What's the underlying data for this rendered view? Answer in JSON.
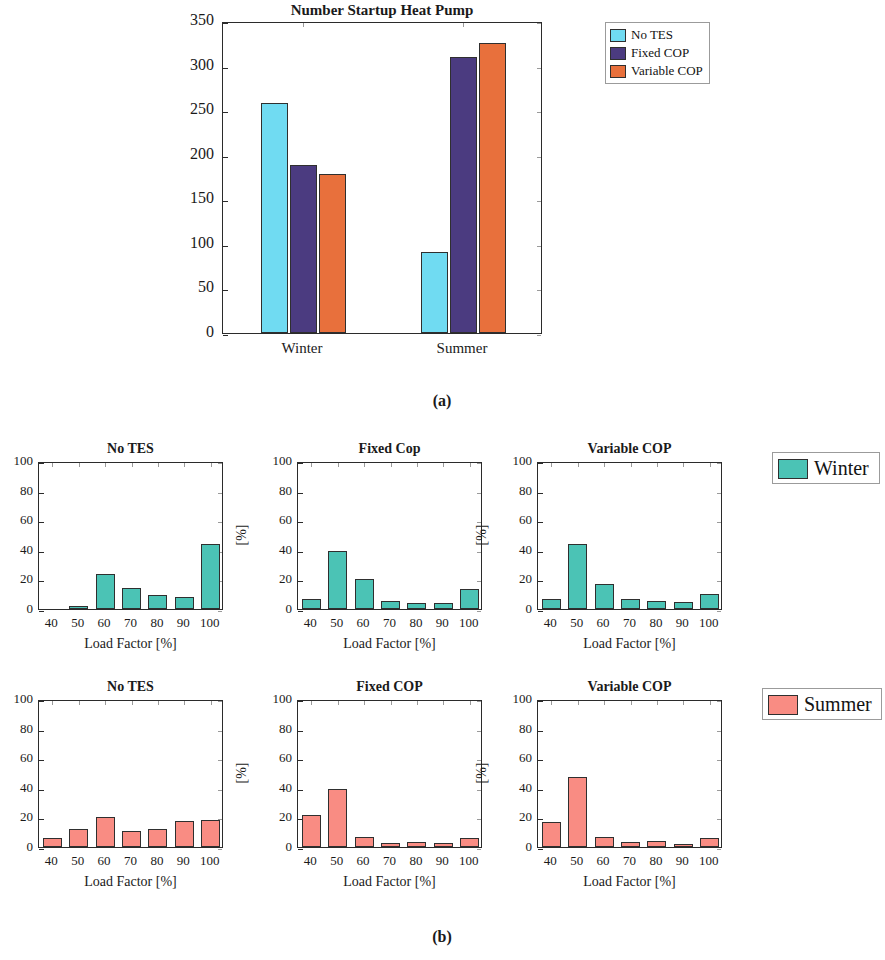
{
  "figure": {
    "subfig_a_label": "(a)",
    "subfig_b_label": "(b)"
  },
  "colors": {
    "no_tes": "#70DBF2",
    "fixed_cop": "#4B3B80",
    "variable_cop": "#E8703C",
    "winter": "#4BC3B5",
    "summer": "#F98C83",
    "axis": "#2b2b2b"
  },
  "panel_a": {
    "title": "Number Startup Heat Pump",
    "legend": [
      "No TES",
      "Fixed COP",
      "Variable COP"
    ],
    "ytick_labels": [
      "350",
      "300",
      "250",
      "200",
      "150",
      "100",
      "50",
      "0"
    ],
    "xtick_labels": [
      "Winter",
      "Summer"
    ]
  },
  "panel_b": {
    "winter_legend": "Winter",
    "summer_legend": "Summer",
    "ytick_labels": [
      "100",
      "80",
      "60",
      "40",
      "20",
      "0"
    ],
    "xtick_labels": [
      "40",
      "50",
      "60",
      "70",
      "80",
      "90",
      "100"
    ],
    "xlabel": "Load Factor [%]",
    "ylabel": "[%]",
    "titles_row1": [
      "No TES",
      "Fixed Cop",
      "Variable COP"
    ],
    "titles_row2": [
      "No TES",
      "Fixed COP",
      "Variable COP"
    ]
  },
  "chart_data": [
    {
      "type": "bar",
      "id": "panel_a",
      "title": "Number Startup Heat Pump",
      "xlabel": "",
      "ylabel": "",
      "categories": [
        "Winter",
        "Summer"
      ],
      "ylim": [
        0,
        350
      ],
      "yticks": [
        0,
        50,
        100,
        150,
        200,
        250,
        300,
        350
      ],
      "grid": false,
      "legend_position": "outside-top-right",
      "series": [
        {
          "name": "No TES",
          "color": "#70DBF2",
          "values": [
            258,
            91
          ]
        },
        {
          "name": "Fixed COP",
          "color": "#4B3B80",
          "values": [
            188,
            310
          ]
        },
        {
          "name": "Variable COP",
          "color": "#E8703C",
          "values": [
            178,
            325
          ]
        }
      ]
    },
    {
      "type": "bar",
      "id": "winter_no_tes",
      "title": "No TES",
      "season": "Winter",
      "xlabel": "Load Factor [%]",
      "ylabel": "[%]",
      "categories": [
        "40",
        "50",
        "60",
        "70",
        "80",
        "90",
        "100"
      ],
      "values": [
        0,
        2,
        23.5,
        14,
        9.5,
        8,
        44
      ],
      "ylim": [
        0,
        100
      ],
      "yticks": [
        0,
        20,
        40,
        60,
        80,
        100
      ],
      "color": "#4BC3B5",
      "grid": false
    },
    {
      "type": "bar",
      "id": "winter_fixed_cop",
      "title": "Fixed Cop",
      "season": "Winter",
      "xlabel": "Load Factor [%]",
      "ylabel": "[%]",
      "categories": [
        "40",
        "50",
        "60",
        "70",
        "80",
        "90",
        "100"
      ],
      "values": [
        7,
        39.5,
        20,
        5.5,
        4,
        4,
        13.5
      ],
      "ylim": [
        0,
        100
      ],
      "yticks": [
        0,
        20,
        40,
        60,
        80,
        100
      ],
      "color": "#4BC3B5",
      "grid": false
    },
    {
      "type": "bar",
      "id": "winter_variable_cop",
      "title": "Variable COP",
      "season": "Winter",
      "xlabel": "Load Factor [%]",
      "ylabel": "[%]",
      "categories": [
        "40",
        "50",
        "60",
        "70",
        "80",
        "90",
        "100"
      ],
      "values": [
        7,
        44,
        17,
        7,
        5.5,
        5,
        10
      ],
      "ylim": [
        0,
        100
      ],
      "yticks": [
        0,
        20,
        40,
        60,
        80,
        100
      ],
      "color": "#4BC3B5",
      "grid": false
    },
    {
      "type": "bar",
      "id": "summer_no_tes",
      "title": "No TES",
      "season": "Summer",
      "xlabel": "Load Factor [%]",
      "ylabel": "[%]",
      "categories": [
        "40",
        "50",
        "60",
        "70",
        "80",
        "90",
        "100"
      ],
      "values": [
        6,
        12.5,
        20.5,
        10.5,
        12,
        17.5,
        18.5
      ],
      "ylim": [
        0,
        100
      ],
      "yticks": [
        0,
        20,
        40,
        60,
        80,
        100
      ],
      "color": "#F98C83",
      "grid": false
    },
    {
      "type": "bar",
      "id": "summer_fixed_cop",
      "title": "Fixed COP",
      "season": "Summer",
      "xlabel": "Load Factor [%]",
      "ylabel": "[%]",
      "categories": [
        "40",
        "50",
        "60",
        "70",
        "80",
        "90",
        "100"
      ],
      "values": [
        21.5,
        39.5,
        7,
        2.5,
        3.5,
        3,
        6
      ],
      "ylim": [
        0,
        100
      ],
      "yticks": [
        0,
        20,
        40,
        60,
        80,
        100
      ],
      "color": "#F98C83",
      "grid": false
    },
    {
      "type": "bar",
      "id": "summer_variable_cop",
      "title": "Variable COP",
      "season": "Summer",
      "xlabel": "Load Factor [%]",
      "ylabel": "[%]",
      "categories": [
        "40",
        "50",
        "60",
        "70",
        "80",
        "90",
        "100"
      ],
      "values": [
        17,
        47,
        7,
        3.5,
        4,
        2,
        6
      ],
      "ylim": [
        0,
        100
      ],
      "yticks": [
        0,
        20,
        40,
        60,
        80,
        100
      ],
      "color": "#F98C83",
      "grid": false
    }
  ]
}
